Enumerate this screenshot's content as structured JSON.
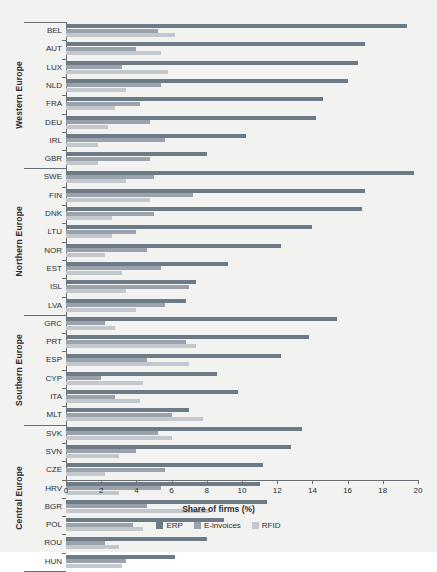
{
  "chart_data": {
    "type": "bar",
    "orientation": "horizontal",
    "title": "",
    "xlabel": "Share of firms (%)",
    "ylabel": "",
    "xlim": [
      0,
      20
    ],
    "xticks": [
      0,
      2,
      4,
      6,
      8,
      10,
      12,
      14,
      16,
      18,
      20
    ],
    "grid": false,
    "legend_position": "bottom",
    "series_names": [
      "ERP",
      "E-invoices",
      "RFID"
    ],
    "colors": {
      "erp": "#6d7b86",
      "einvoices": "#9aa3ab",
      "rfid": "#c3c8cc",
      "axis": "#6b6f72",
      "background": "#f2f2f0",
      "text": "#2b2f33"
    },
    "groups": [
      {
        "label": "Western Europe",
        "categories": [
          "BEL",
          "AUT",
          "LUX",
          "NLD",
          "FRA",
          "DEU",
          "IRL",
          "GBR"
        ],
        "series": [
          {
            "name": "ERP",
            "values": [
              19.4,
              17.0,
              16.6,
              16.0,
              14.6,
              14.2,
              10.2,
              8.0
            ]
          },
          {
            "name": "E-invoices",
            "values": [
              5.2,
              4.0,
              3.2,
              5.4,
              4.2,
              4.8,
              5.6,
              4.8
            ]
          },
          {
            "name": "RFID",
            "values": [
              6.2,
              5.4,
              5.8,
              3.4,
              2.8,
              2.4,
              1.8,
              1.8
            ]
          }
        ]
      },
      {
        "label": "Northern Europe",
        "categories": [
          "SWE",
          "FIN",
          "DNK",
          "LTU",
          "NOR",
          "EST",
          "ISL",
          "LVA"
        ],
        "series": [
          {
            "name": "ERP",
            "values": [
              19.8,
              17.0,
              16.8,
              14.0,
              12.2,
              9.2,
              7.4,
              6.8
            ]
          },
          {
            "name": "E-invoices",
            "values": [
              5.0,
              7.2,
              5.0,
              4.0,
              4.6,
              5.4,
              7.0,
              5.6
            ]
          },
          {
            "name": "RFID",
            "values": [
              3.4,
              4.8,
              2.6,
              2.6,
              2.2,
              3.2,
              3.4,
              4.0
            ]
          }
        ]
      },
      {
        "label": "Southern Europe",
        "categories": [
          "GRC",
          "PRT",
          "ESP",
          "CYP",
          "ITA",
          "MLT"
        ],
        "series": [
          {
            "name": "ERP",
            "values": [
              15.4,
              13.8,
              12.2,
              8.6,
              9.8,
              7.0
            ]
          },
          {
            "name": "E-invoices",
            "values": [
              2.2,
              6.8,
              4.6,
              2.0,
              2.8,
              6.0
            ]
          },
          {
            "name": "RFID",
            "values": [
              2.8,
              7.4,
              7.0,
              4.4,
              4.2,
              7.8
            ]
          }
        ]
      },
      {
        "label": "Central Europe",
        "categories": [
          "SVK",
          "SVN",
          "CZE",
          "HRV",
          "BGR",
          "POL",
          "ROU",
          "HUN"
        ],
        "series": [
          {
            "name": "ERP",
            "values": [
              13.4,
              12.8,
              11.2,
              11.0,
              11.4,
              9.0,
              8.0,
              6.2
            ]
          },
          {
            "name": "E-invoices",
            "values": [
              5.2,
              4.0,
              5.6,
              5.4,
              4.6,
              3.8,
              2.2,
              3.4
            ]
          },
          {
            "name": "RFID",
            "values": [
              6.0,
              3.0,
              2.2,
              3.0,
              8.2,
              4.4,
              3.0,
              3.2
            ]
          }
        ]
      }
    ]
  }
}
